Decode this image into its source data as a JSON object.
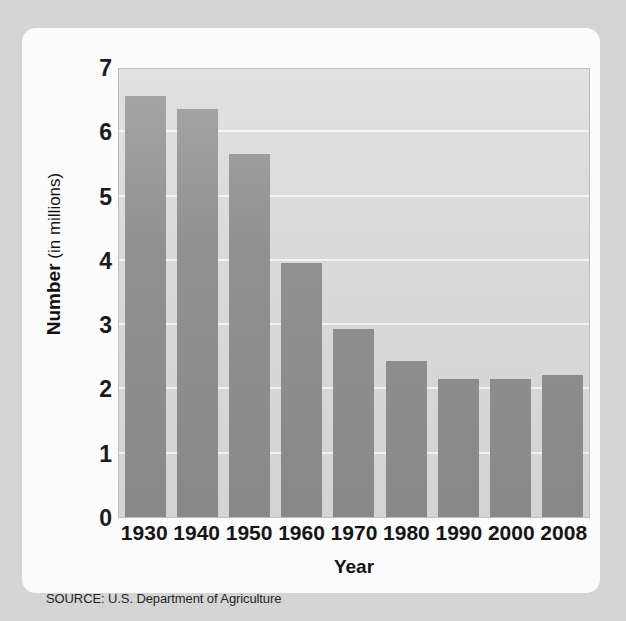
{
  "card": {
    "background_color": "#fdfdfd",
    "page_background_color": "#d6d6d6"
  },
  "source": {
    "text": "SOURCE: U.S. Department of Agriculture"
  },
  "chart_data": {
    "type": "bar",
    "title": "",
    "subtitle": "",
    "categories": [
      "1930",
      "1940",
      "1950",
      "1960",
      "1970",
      "1980",
      "1990",
      "2000",
      "2008"
    ],
    "values": [
      6.55,
      6.35,
      5.65,
      3.95,
      2.93,
      2.43,
      2.14,
      2.15,
      2.21
    ],
    "xlabel": "Year",
    "ylabel": "Number (in millions)",
    "ylabel_parts": {
      "strong": "Number",
      "light": " (in millions)"
    },
    "ylim": [
      0,
      7
    ],
    "ytick_labels": [
      "7",
      "6",
      "5",
      "4",
      "3",
      "2",
      "1",
      "0"
    ],
    "ytick_values": [
      7,
      6,
      5,
      4,
      3,
      2,
      1,
      0
    ],
    "grid": true,
    "grid_orientation": "horizontal",
    "gridline_color": "#f5f5f5",
    "legend": "none",
    "bar_color": "#8b8b8b",
    "plot_background_color": "#d9d9d9"
  }
}
